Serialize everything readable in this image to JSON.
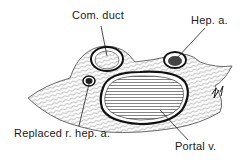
{
  "diagram": {
    "type": "anatomical cross-section illustration",
    "labels": {
      "common_duct": "Com. duct",
      "hepatic_artery": "Hep. a.",
      "replaced_right_hepatic_artery": "Replaced r. hep. a.",
      "portal_vein": "Portal v."
    },
    "structures": [
      {
        "name": "common-duct",
        "label": "Com. duct"
      },
      {
        "name": "hepatic-artery",
        "label": "Hep. a."
      },
      {
        "name": "replaced-right-hepatic-artery",
        "label": "Replaced r. hep. a."
      },
      {
        "name": "portal-vein",
        "label": "Portal v."
      }
    ],
    "colors": {
      "ink": "#1a1a1a",
      "background": "#ffffff"
    }
  }
}
